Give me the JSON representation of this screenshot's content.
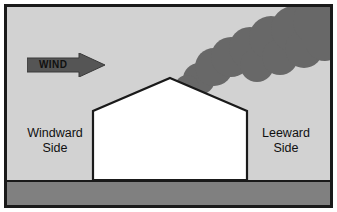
{
  "diagram": {
    "wind_arrow": {
      "label": "WIND",
      "direction": "right",
      "color": "#555555"
    },
    "labels": {
      "windward_line1": "Windward",
      "windward_line2": "Side",
      "leeward_line1": "Leeward",
      "leeward_line2": "Side"
    },
    "colors": {
      "sky": "#d2d2d2",
      "ground": "#808080",
      "house": "#ffffff",
      "smoke": "#686868",
      "outline": "#1a1a1a",
      "frame": "#1a1a1a",
      "page": "#ffffff"
    },
    "elements": {
      "house_name": "house",
      "roof_name": "gable-roof",
      "ground_name": "ground-band",
      "sky_name": "sky-background",
      "smoke_name": "smoke-plume"
    }
  }
}
